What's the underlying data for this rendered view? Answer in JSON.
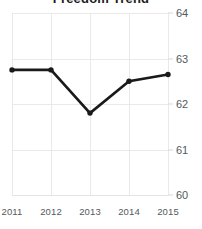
{
  "chart_data": {
    "type": "line",
    "title": "Freedom Trend",
    "xlabel": "",
    "ylabel": "",
    "categories": [
      "2011",
      "2012",
      "2013",
      "2014",
      "2015"
    ],
    "x": [
      2011,
      2012,
      2013,
      2014,
      2015
    ],
    "values": [
      62.75,
      62.75,
      61.8,
      62.5,
      62.65
    ],
    "series": [
      {
        "name": "Freedom Trend",
        "values": [
          62.75,
          62.75,
          61.8,
          62.5,
          62.65
        ]
      }
    ],
    "ylim": [
      60,
      64
    ],
    "xlim": [
      2011,
      2015
    ],
    "yticks": [
      64,
      63,
      62,
      61,
      60
    ],
    "ytick_labels": [
      "64",
      "63",
      "62",
      "61",
      "60"
    ],
    "xticks": [
      2011,
      2012,
      2013,
      2014,
      2015
    ],
    "xtick_labels": [
      "2011",
      "2012",
      "2013",
      "2014",
      "2015"
    ],
    "grid": true,
    "grid_axis": "both",
    "legend": false,
    "legend_position": "none",
    "markers": true,
    "marker_shape": "circle",
    "line_color": "#1a1a1a",
    "marker_color": "#1a1a1a",
    "grid_color": "#e9e9e9",
    "tick_label_color": "#55595c",
    "title_color": "#1b1b1b",
    "background_color": "#ffffff",
    "y_axis_side": "right"
  }
}
